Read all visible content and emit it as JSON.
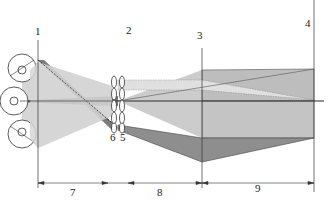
{
  "diagram": {
    "type": "optical-ray-diagram",
    "plane_labels": [
      "1",
      "2",
      "3",
      "4"
    ],
    "lens_labels": [
      "6",
      "5"
    ],
    "dimension_labels": [
      "7",
      "8",
      "9"
    ],
    "colors": {
      "light_beam": "#d4d4d4",
      "mid_beam": "#b9b9b9",
      "dark_beam": "#8a8a8a",
      "line": "#333333",
      "background": "#ffffff"
    }
  }
}
